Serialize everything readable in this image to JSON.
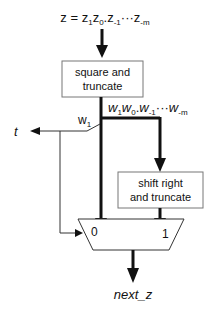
{
  "diagram": {
    "input_label": {
      "lhs": "z",
      "eq": " = ",
      "terms": [
        {
          "base": "z",
          "sub": "1"
        },
        {
          "base": "z",
          "sub": "0"
        },
        {
          "sep": "."
        },
        {
          "base": "z",
          "sub": "-1"
        },
        {
          "sep": "···"
        },
        {
          "base": "z",
          "sub": "-m"
        }
      ]
    },
    "box_square": {
      "line1": "square and",
      "line2": "truncate"
    },
    "box_shift": {
      "line1": "shift right",
      "line2": "and truncate"
    },
    "w_label": {
      "terms": [
        {
          "base": "w",
          "sub": "1"
        },
        {
          "base": "w",
          "sub": "0"
        },
        {
          "sep": "."
        },
        {
          "base": "w",
          "sub": "-1"
        },
        {
          "sep": "···"
        },
        {
          "base": "w",
          "sub": "-m"
        }
      ]
    },
    "t_label": "t",
    "w1_label": {
      "base": "w",
      "sub": "1"
    },
    "mux": {
      "input0": "0",
      "input1": "1"
    },
    "output_label": "next_z",
    "colors": {
      "stroke": "#111111",
      "box_border": "#777777",
      "background": "#ffffff"
    }
  }
}
